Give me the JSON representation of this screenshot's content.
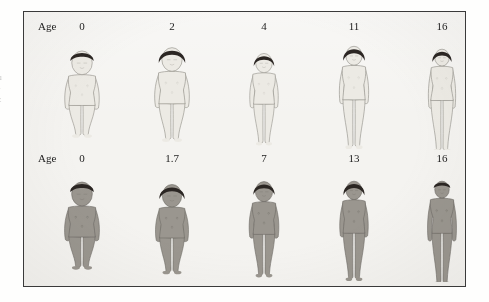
{
  "figure": {
    "background_color": "#f4f3f0",
    "border_color": "#3a3a3a",
    "page_color": "#fefefd"
  },
  "margin_note": {
    "line1": "u",
    "line2": "-",
    "line3": "c"
  },
  "rows": [
    {
      "id": "row-female",
      "age_label": "Age",
      "skin_color": "#eceae4",
      "outline_color": "#8f8d86",
      "hair_color": "#2b2623",
      "subjects": [
        {
          "age": "0",
          "x": 58,
          "height": 103,
          "width": 46,
          "type": "infant"
        },
        {
          "age": "2",
          "x": 148,
          "height": 106,
          "width": 50,
          "type": "toddler"
        },
        {
          "age": "4",
          "x": 240,
          "height": 100,
          "width": 40,
          "type": "child"
        },
        {
          "age": "11",
          "x": 330,
          "height": 107,
          "width": 42,
          "type": "preteen"
        },
        {
          "age": "16",
          "x": 418,
          "height": 110,
          "width": 40,
          "type": "teen-female"
        }
      ]
    },
    {
      "id": "row-male",
      "age_label": "Age",
      "skin_color": "#9a968f",
      "outline_color": "#6d6a64",
      "hair_color": "#2b2623",
      "subjects": [
        {
          "age": "0",
          "x": 58,
          "height": 104,
          "width": 48,
          "type": "infant"
        },
        {
          "age": "1.7",
          "x": 148,
          "height": 101,
          "width": 45,
          "type": "toddler"
        },
        {
          "age": "7",
          "x": 240,
          "height": 104,
          "width": 40,
          "type": "child"
        },
        {
          "age": "13",
          "x": 330,
          "height": 108,
          "width": 40,
          "type": "preteen"
        },
        {
          "age": "16",
          "x": 418,
          "height": 112,
          "width": 40,
          "type": "teen-male"
        }
      ]
    }
  ]
}
